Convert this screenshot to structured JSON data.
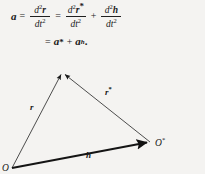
{
  "figure": {
    "background_color": "#f4f3f1",
    "ink_color": "#161616"
  },
  "equation": {
    "line1": {
      "lhs": "a",
      "eq1": "=",
      "frac1": {
        "numerator": "d²r",
        "denominator": "dt²"
      },
      "eq2": "=",
      "frac2": {
        "numerator": "d²r*",
        "denominator": "dt²"
      },
      "plus": "+",
      "frac3": {
        "numerator": "d²h",
        "denominator": "dt²"
      },
      "parts": {
        "d": "d",
        "exp2": "2",
        "r": "r",
        "star": "*",
        "h": "h",
        "dt": "dt"
      }
    },
    "line2": {
      "eq": "=",
      "term1": "a",
      "term1_star": "*",
      "plus": "+",
      "term2": "a",
      "term2_sub": "h",
      "period": "."
    }
  },
  "diagram": {
    "type": "vector-triangle",
    "points": {
      "O": {
        "label": "O",
        "x": 12,
        "y": 112
      },
      "P": {
        "label": "",
        "x": 62,
        "y": 16
      },
      "Ostar": {
        "label": "O",
        "label_star": "*",
        "x": 150,
        "y": 86
      }
    },
    "vectors": [
      {
        "name": "r",
        "label": "r",
        "label_star": "",
        "from": "O",
        "to": "P",
        "weight": "thin"
      },
      {
        "name": "rstar",
        "label": "r",
        "label_star": "*",
        "from": "Ostar",
        "to": "P",
        "weight": "thin"
      },
      {
        "name": "h",
        "label": "h",
        "label_star": "",
        "from": "O",
        "to": "Ostar",
        "weight": "thick"
      }
    ]
  }
}
